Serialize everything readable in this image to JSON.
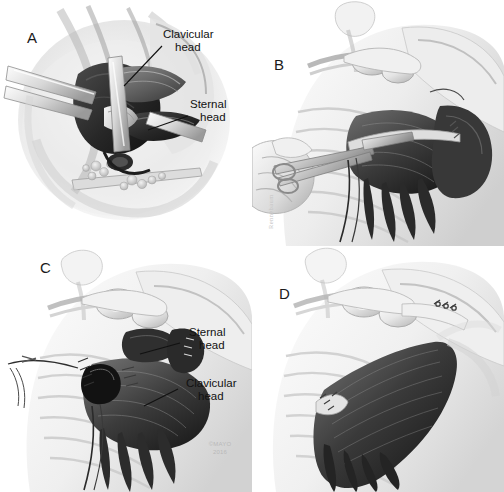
{
  "figure": {
    "width": 504,
    "height": 492,
    "background_color": "#ffffff",
    "ink_color": "#111111",
    "panel_count": 4
  },
  "panels": [
    {
      "id": "A",
      "letter": "A",
      "description": "Intraoperative close-up of retracted surgical exposure showing the torn pectoralis major tendon with its two heads identified",
      "annotations": [
        {
          "label_line1": "Clavicular",
          "label_line2": "head",
          "side": "right"
        },
        {
          "label_line1": "Sternal",
          "label_line2": "head",
          "side": "right"
        }
      ]
    },
    {
      "id": "B",
      "letter": "B",
      "description": "Surgeon's hand holding a clamp on the retracted pectoralis major tendon over the anterior chest wall and shoulder",
      "annotations": [],
      "artist_signature": "Rennebaum"
    },
    {
      "id": "C",
      "letter": "C",
      "description": "Suture anchors placed in the humerus with sutures passed through the sternal and clavicular heads of the pectoralis major",
      "annotations": [
        {
          "label_line1": "Sternal",
          "label_line2": "head",
          "side": "right"
        },
        {
          "label_line1": "Clavicular",
          "label_line2": "head",
          "side": "right"
        }
      ]
    },
    {
      "id": "D",
      "letter": "D",
      "description": "Completed repair showing the pectoralis major tendon reattached to the humerus with restored anatomic fan of muscle fibers",
      "annotations": []
    }
  ],
  "copyright": {
    "line1": "©MAYO",
    "line2": "2016"
  }
}
